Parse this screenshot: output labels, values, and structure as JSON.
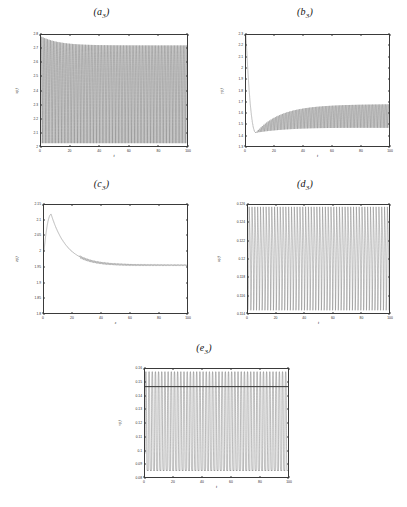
{
  "figure": {
    "background": "#ffffff",
    "line_color": "#4d4d4d",
    "axis_color": "#3a3a3a"
  },
  "chart_data": [
    {
      "id": "a3",
      "type": "line",
      "title": "(a3)",
      "title_base": "(a",
      "title_sub": "3",
      "title_close": ")",
      "xlabel": "t",
      "ylabel": "x(t)",
      "xlim": [
        0,
        100
      ],
      "ylim": [
        2.0,
        2.8
      ],
      "xticks": [
        0,
        20,
        40,
        60,
        80,
        100
      ],
      "xticklabels": [
        "0",
        "20",
        "40",
        "60",
        "80",
        "100"
      ],
      "yticks": [
        2.0,
        2.1,
        2.2,
        2.3,
        2.4,
        2.5,
        2.6,
        2.7,
        2.8
      ],
      "yticklabels": [
        "2",
        "2.1",
        "2.2",
        "2.3",
        "2.4",
        "2.5",
        "2.6",
        "2.7",
        "2.8"
      ],
      "grid": false,
      "description": "Dense sustained high-frequency oscillation filling nearly the full vertical range; upper envelope starts at 2.79, settles to about 2.72; lower envelope near 2.02.",
      "waveform": {
        "kind": "dense-oscillation",
        "cycles": 100,
        "upper_start": 2.79,
        "upper_settle": 2.725,
        "lower_start": 2.02,
        "lower_settle": 2.02,
        "settle_time": 12
      }
    },
    {
      "id": "b3",
      "type": "line",
      "title": "(b3)",
      "title_base": "(b",
      "title_sub": "3",
      "title_close": ")",
      "xlabel": "t",
      "ylabel": "y(t)",
      "xlim": [
        0,
        100
      ],
      "ylim": [
        1.3,
        2.3
      ],
      "xticks": [
        0,
        20,
        40,
        60,
        80,
        100
      ],
      "xticklabels": [
        "0",
        "20",
        "40",
        "60",
        "80",
        "100"
      ],
      "yticks": [
        1.3,
        1.4,
        1.5,
        1.6,
        1.7,
        1.8,
        1.9,
        2.0,
        2.1,
        2.2,
        2.3
      ],
      "yticklabels": [
        "1.3",
        "1.4",
        "1.5",
        "1.6",
        "1.7",
        "1.8",
        "1.9",
        "2",
        "2.1",
        "2.2",
        "2.3"
      ],
      "grid": false,
      "description": "Starts at 2.3, drops steeply to a minimum near 1.42 around t=7, then oscillations grow and the envelope widens slowly, converging to a band between about 1.50 and 1.72.",
      "waveform": {
        "kind": "damped-transient-oscillation",
        "cycles": 100,
        "start_value": 2.3,
        "dip_value": 1.42,
        "dip_time": 7,
        "upper_settle": 1.72,
        "lower_settle": 1.5,
        "settle_time": 60
      }
    },
    {
      "id": "c3",
      "type": "line",
      "title": "(c3)",
      "title_base": "(c",
      "title_sub": "3",
      "title_close": ")",
      "xlabel": "z",
      "ylabel": "z(t)",
      "xlim": [
        0,
        100
      ],
      "ylim": [
        1.8,
        2.15
      ],
      "xticks": [
        0,
        20,
        40,
        60,
        80,
        100
      ],
      "xticklabels": [
        "0",
        "20",
        "40",
        "60",
        "80",
        "100"
      ],
      "yticks": [
        1.8,
        1.85,
        1.9,
        1.95,
        2.0,
        2.05,
        2.1,
        2.15
      ],
      "yticklabels": [
        "1.8",
        "1.85",
        "1.9",
        "1.95",
        "2",
        "2.05",
        "2.1",
        "2.15"
      ],
      "grid": false,
      "description": "Smooth rise from 2.0 at t=0 to a peak of about 2.12 near t=5, then a monotonic decay that flattens onto a steady value close to 1.955 with a very fine ripple.",
      "waveform": {
        "kind": "peak-decay",
        "start_value": 2.0,
        "peak_value": 2.12,
        "peak_time": 5,
        "settle_value": 1.955,
        "decay_rate": 0.09,
        "ripple": 0.004
      }
    },
    {
      "id": "d3",
      "type": "line",
      "title": "(d3)",
      "title_base": "(d",
      "title_sub": "3",
      "title_close": ")",
      "xlabel": "t",
      "ylabel": "u(t)",
      "xlim": [
        0,
        100
      ],
      "ylim": [
        0.114,
        0.126
      ],
      "xticks": [
        0,
        20,
        40,
        60,
        80,
        100
      ],
      "xticklabels": [
        "0",
        "20",
        "40",
        "60",
        "80",
        "100"
      ],
      "yticks": [
        0.114,
        0.116,
        0.118,
        0.12,
        0.122,
        0.124,
        0.126
      ],
      "yticklabels": [
        "0.114",
        "0.116",
        "0.118",
        "0.12",
        "0.122",
        "0.124",
        "0.126"
      ],
      "grid": false,
      "description": "Sustained spiking oscillation with sharp narrow peaks reaching about 0.1258 and troughs near 0.1143; spike rate roughly one every two time units, amplitude nearly constant across the record.",
      "waveform": {
        "kind": "spike-train",
        "cycles": 50,
        "upper": 0.1258,
        "lower": 0.1143,
        "duty": 0.42
      }
    },
    {
      "id": "e3",
      "type": "line",
      "title": "(e3)",
      "title_base": "(e",
      "title_sub": "3",
      "title_close": ")",
      "xlabel": "t",
      "ylabel": "v(t)",
      "xlim": [
        0,
        100
      ],
      "ylim": [
        0.08,
        0.16
      ],
      "xticks": [
        0,
        20,
        40,
        60,
        80,
        100
      ],
      "xticklabels": [
        "0",
        "20",
        "40",
        "60",
        "80",
        "100"
      ],
      "yticks": [
        0.08,
        0.09,
        0.1,
        0.11,
        0.12,
        0.13,
        0.14,
        0.15,
        0.16
      ],
      "yticklabels": [
        "0.08",
        "0.09",
        "0.1",
        "0.11",
        "0.12",
        "0.13",
        "0.14",
        "0.15",
        "0.16"
      ],
      "grid": false,
      "description": "Large relaxation-oscillation square-like bursts spanning nearly the full axis, from about 0.0845 up to 0.1585, with a dense dark band of trajectory crossings near 0.147 and roughly 45 bursts over the interval.",
      "waveform": {
        "kind": "relaxation-burst",
        "cycles": 45,
        "upper": 0.1585,
        "lower": 0.0845,
        "band_level": 0.147,
        "duty": 0.5
      }
    }
  ]
}
